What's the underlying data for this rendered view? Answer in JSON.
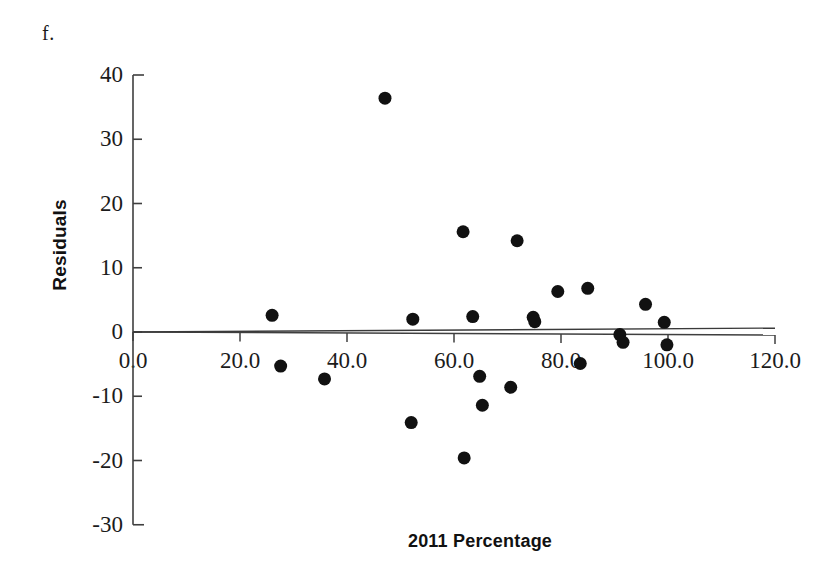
{
  "figure": {
    "panel_label": "f.",
    "x_axis_title": "2011 Percentage",
    "y_axis_title": "Residuals"
  },
  "chart_data": {
    "type": "scatter",
    "title": "f.",
    "xlabel": "2011 Percentage",
    "ylabel": "Residuals",
    "xlim": [
      0,
      120
    ],
    "ylim": [
      -30,
      40
    ],
    "grid": false,
    "legend": null,
    "marker": {
      "shape": "circle",
      "color": "#111111",
      "size_px": 13
    },
    "reference_line": {
      "type": "linear",
      "description": "near-horizontal trend line through residual zero",
      "y_at_x0": 0.0,
      "y_at_x120": 0.6,
      "color": "#3a3a3a"
    },
    "x_ticks": [
      0.0,
      20.0,
      40.0,
      60.0,
      80.0,
      100.0,
      120.0
    ],
    "x_tick_labels": [
      "0.0",
      "20.0",
      "40.0",
      "60.0",
      "80.0",
      "100.0",
      "120.0"
    ],
    "y_ticks": [
      -30,
      -20,
      -10,
      0,
      10,
      20,
      30,
      40
    ],
    "y_tick_labels": [
      "-30",
      "-20",
      "-10",
      "0",
      "10",
      "20",
      "30",
      "40"
    ],
    "n_points": 24,
    "x": [
      26.0,
      27.6,
      35.8,
      47.1,
      52.3,
      61.7,
      61.9,
      63.5,
      64.8,
      65.3,
      65.6,
      70.6,
      71.8,
      74.8,
      75.1,
      79.4,
      83.6,
      85.0,
      91.0,
      91.6,
      95.8,
      99.3,
      99.8,
      52.0
    ],
    "y": [
      2.6,
      -5.3,
      -7.3,
      36.4,
      2.0,
      15.6,
      -19.6,
      2.4,
      -6.9,
      -11.4,
      -11.4,
      -8.6,
      14.2,
      2.3,
      1.6,
      6.3,
      -4.9,
      6.8,
      -0.4,
      -1.6,
      4.3,
      1.5,
      -2.0,
      2.0
    ],
    "points": [
      {
        "x": 26.0,
        "y": 2.6
      },
      {
        "x": 27.6,
        "y": -5.3
      },
      {
        "x": 35.8,
        "y": -7.3
      },
      {
        "x": 47.1,
        "y": 36.4
      },
      {
        "x": 52.3,
        "y": 2.0
      },
      {
        "x": 52.0,
        "y": -14.1
      },
      {
        "x": 61.7,
        "y": 15.6
      },
      {
        "x": 61.9,
        "y": -19.6
      },
      {
        "x": 63.5,
        "y": 2.4
      },
      {
        "x": 64.8,
        "y": -6.9
      },
      {
        "x": 65.3,
        "y": -11.4
      },
      {
        "x": 70.6,
        "y": -8.6
      },
      {
        "x": 71.8,
        "y": 14.2
      },
      {
        "x": 74.8,
        "y": 2.3
      },
      {
        "x": 75.1,
        "y": 1.6
      },
      {
        "x": 79.4,
        "y": 6.3
      },
      {
        "x": 83.6,
        "y": -4.9
      },
      {
        "x": 85.0,
        "y": 6.8
      },
      {
        "x": 91.0,
        "y": -0.4
      },
      {
        "x": 91.6,
        "y": -1.6
      },
      {
        "x": 95.8,
        "y": 4.3
      },
      {
        "x": 99.3,
        "y": 1.5
      },
      {
        "x": 99.8,
        "y": -2.0
      }
    ]
  }
}
